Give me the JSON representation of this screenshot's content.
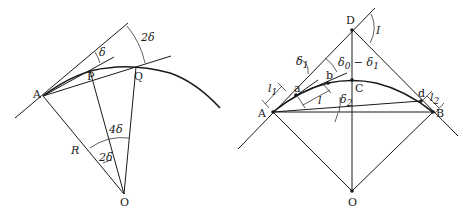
{
  "figure_left": {
    "points": {
      "A": "A",
      "P": "P",
      "Q": "Q",
      "O": "O"
    },
    "labels": {
      "radius": "R",
      "angle_tangent_chordP": "δ",
      "angle_tangent_chordQ": "2δ",
      "angle_center_AQ": "4δ",
      "angle_center_AP": "2δ"
    }
  },
  "figure_right": {
    "points": {
      "A": "A",
      "B": "B",
      "C": "C",
      "D": "D",
      "O": "O",
      "a": "a",
      "b": "b",
      "d": "d"
    },
    "labels": {
      "intersection_angle": "I",
      "delta1": "δ",
      "delta1_sub": "1",
      "delta0_minus_delta1": "δ",
      "delta0_sub": "0",
      "minus": " − δ",
      "delta1b_sub": "1",
      "delta2": "δ",
      "delta2_sub": "2",
      "l1": "l",
      "l1_sub": "1",
      "l": "l",
      "l2": "l",
      "l2_sub": "2"
    }
  }
}
